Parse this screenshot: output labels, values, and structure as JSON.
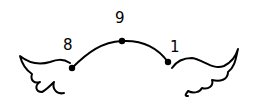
{
  "diagram": {
    "nodes": [
      {
        "id": "left",
        "label": "8",
        "x": 72,
        "y": 68
      },
      {
        "id": "top",
        "label": "9",
        "x": 122,
        "y": 41
      },
      {
        "id": "right",
        "label": "1",
        "x": 168,
        "y": 62
      }
    ],
    "wings": [
      "left-wing",
      "right-wing"
    ],
    "colors": {
      "ink": "#000000",
      "background": "#ffffff"
    }
  }
}
